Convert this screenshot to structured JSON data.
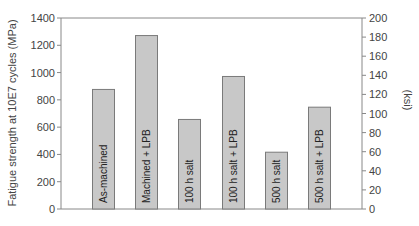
{
  "chart_data": {
    "type": "bar",
    "title": "",
    "xlabel": "",
    "ylabel": "Fatigue strength at 10E7 cycles (MPa)",
    "y2label": "(ksi)",
    "ylim": [
      0,
      1400
    ],
    "y2lim": [
      0,
      200
    ],
    "yticks": [
      0,
      200,
      400,
      600,
      800,
      1000,
      1200,
      1400
    ],
    "y2ticks": [
      0,
      20,
      40,
      60,
      80,
      100,
      120,
      140,
      160,
      180,
      200
    ],
    "grid": false,
    "legend": null,
    "categories": [
      "As-machined",
      "Machined + LPB",
      "100 h salt",
      "100 h salt + LPB",
      "500 h salt",
      "500 h salt + LPB"
    ],
    "values": [
      880,
      1275,
      660,
      975,
      420,
      750
    ],
    "bar_fill": "#c8c8c8",
    "bar_stroke": "#7a7a7a",
    "axis_color": "#888888"
  }
}
